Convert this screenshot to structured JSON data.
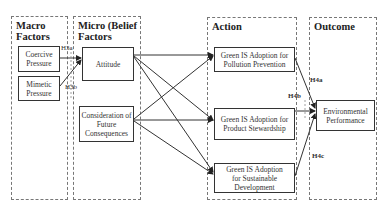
{
  "diagram": {
    "groups": {
      "macro": {
        "title": "Macro Factors"
      },
      "micro": {
        "title": "Micro (Belief Factors"
      },
      "action": {
        "title": "Action"
      },
      "outcome": {
        "title": "Outcome"
      }
    },
    "nodes": {
      "coercive": "Coercive Pressure",
      "mimetic": "Mimetic Pressure",
      "attitude": "Attitude",
      "consideration": "Consideration of Future Consequences",
      "pollution": "Green IS Adoption for Pollution Prevention",
      "stewardship": "Green IS Adoption for Product Stewardship",
      "sustainable": "Green IS Adoption for Sustainable Development",
      "performance": "Environmental Performance"
    },
    "hypotheses": {
      "h3a": "H3a",
      "h3b": "H3b",
      "h4a": "H4a",
      "h4b": "H4b",
      "h4c": "H4c"
    },
    "edges": [
      {
        "from": "coercive",
        "to": "attitude",
        "label": "H3a"
      },
      {
        "from": "mimetic",
        "to": "attitude",
        "label": "H3b"
      },
      {
        "from": "attitude",
        "to": "pollution"
      },
      {
        "from": "attitude",
        "to": "stewardship"
      },
      {
        "from": "attitude",
        "to": "sustainable"
      },
      {
        "from": "consideration",
        "to": "pollution"
      },
      {
        "from": "consideration",
        "to": "stewardship"
      },
      {
        "from": "consideration",
        "to": "sustainable"
      },
      {
        "from": "pollution",
        "to": "performance",
        "label": "H4a"
      },
      {
        "from": "stewardship",
        "to": "performance",
        "label": "H4b"
      },
      {
        "from": "sustainable",
        "to": "performance",
        "label": "H4c"
      }
    ]
  }
}
